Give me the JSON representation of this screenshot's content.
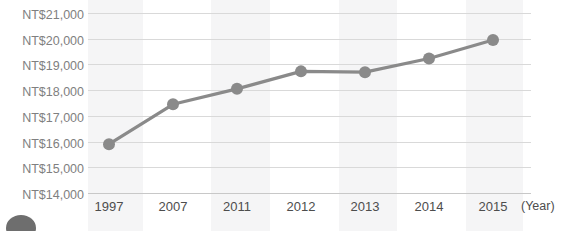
{
  "chart_data": {
    "type": "line",
    "title": "",
    "subtitle": "",
    "xlabel": "(Year)",
    "ylabel": "",
    "categories": [
      "1997",
      "2007",
      "2011",
      "2012",
      "2013",
      "2014",
      "2015"
    ],
    "values": [
      15900,
      17450,
      18050,
      18730,
      18700,
      19230,
      19950
    ],
    "series": [
      {
        "name": "",
        "values": [
          15900,
          17450,
          18050,
          18730,
          18700,
          19230,
          19950
        ]
      }
    ],
    "ylim": [
      14000,
      21000
    ],
    "ytick_values": [
      21000,
      20000,
      19000,
      18000,
      17000,
      16000,
      15000,
      14000
    ],
    "ytick_labels": [
      "NT$21,000",
      "NT$20,000",
      "NT$19,000",
      "NT$18,000",
      "NT$17,000",
      "NT$16,000",
      "NT$15,000",
      "NT$14,000"
    ],
    "currency_prefix": "NT$",
    "grid": true,
    "legend": false,
    "legend_position": "none",
    "marker": "circle",
    "line_color": "#8a8a8a",
    "marker_color": "#8a8a8a",
    "grid_color": "#d9d9d9",
    "tick_label_color": "#808080",
    "axis_label_color": "#4d4d4d",
    "background_color": "#ffffff",
    "band_color": "#f3f3f4"
  },
  "axis": {
    "x_unit_label": "(Year)"
  }
}
